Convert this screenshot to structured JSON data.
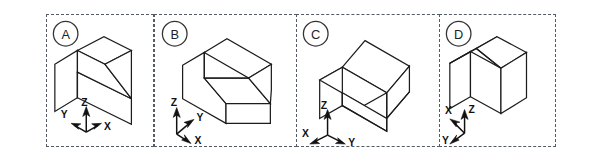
{
  "figure": {
    "background_color": "#ffffff",
    "line_color": "#1c1c1c",
    "border_style": "dashed",
    "border_color": "#555b66",
    "panel_count": 4
  },
  "panels": [
    {
      "id": "A",
      "label": "A",
      "object_description": "rectangular block with single sloped chamfer face across the top",
      "viewpoint": "top-front-right with slope descending to the right",
      "axes": {
        "origin_label": "triad",
        "z": {
          "label": "Z",
          "direction": "up",
          "label_position": "above-left"
        },
        "y": {
          "label": "Y",
          "direction": "upper-left-outward",
          "label_position": "left"
        },
        "x": {
          "label": "X",
          "direction": "lower-right-outward",
          "label_position": "right"
        }
      }
    },
    {
      "id": "B",
      "label": "B",
      "object_description": "rectangular block with single sloped chamfer face across the top",
      "viewpoint": "slope descending toward viewer front-right",
      "axes": {
        "origin_label": "triad",
        "z": {
          "label": "Z",
          "direction": "up",
          "label_position": "above-left"
        },
        "y": {
          "label": "Y",
          "direction": "upper-right",
          "label_position": "right"
        },
        "x": {
          "label": "X",
          "direction": "lower-right",
          "label_position": "right"
        }
      }
    },
    {
      "id": "C",
      "label": "C",
      "object_description": "rectangular block with single sloped chamfer face across the top",
      "viewpoint": "slope descending to the lower right",
      "axes": {
        "origin_label": "triad",
        "z": {
          "label": "Z",
          "direction": "up",
          "label_position": "above-left"
        },
        "x": {
          "label": "X",
          "direction": "lower-left",
          "label_position": "left"
        },
        "y": {
          "label": "Y",
          "direction": "lower-right",
          "label_position": "right"
        }
      }
    },
    {
      "id": "D",
      "label": "D",
      "object_description": "rectangular block with single sloped chamfer face across the top",
      "viewpoint": "slope descending to the left",
      "axes": {
        "origin_label": "triad",
        "z": {
          "label": "Z",
          "direction": "up",
          "label_position": "right"
        },
        "x": {
          "label": "X",
          "direction": "upper-left",
          "label_position": "above-left"
        },
        "y": {
          "label": "Y",
          "direction": "lower-left",
          "label_position": "lower-left"
        }
      }
    }
  ]
}
